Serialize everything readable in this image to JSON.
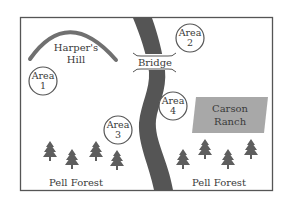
{
  "map": {
    "colors": {
      "river": "#555555",
      "hill_arc": "#707070",
      "tree": "#5e5e5e",
      "ranch_fill": "#a8a8a8",
      "border": "#555555",
      "text": "#3a3a3a"
    },
    "landmarks": {
      "harpers_hill": {
        "line1": "Harper's",
        "line2": "Hill"
      },
      "bridge": {
        "label": "Bridge"
      },
      "carson_ranch": {
        "line1": "Carson",
        "line2": "Ranch"
      },
      "pell_forest_left": {
        "label": "Pell Forest"
      },
      "pell_forest_right": {
        "label": "Pell Forest"
      }
    },
    "areas": [
      {
        "word": "Area",
        "num": "1"
      },
      {
        "word": "Area",
        "num": "2"
      },
      {
        "word": "Area",
        "num": "3"
      },
      {
        "word": "Area",
        "num": "4"
      }
    ]
  }
}
